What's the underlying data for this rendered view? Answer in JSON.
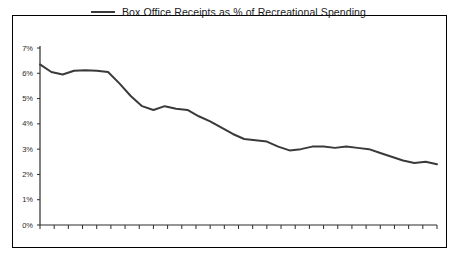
{
  "figure": {
    "width": 457,
    "height": 265,
    "background": "#ffffff",
    "border_color": "#000000"
  },
  "legend": {
    "position": "top-center",
    "marker": "line-swatch",
    "label": "Box Office Receipts as % of Recreational Spending",
    "color": "#3a3a3a"
  },
  "chart_data": {
    "type": "line",
    "title": "",
    "subtitle": "",
    "xlabel": "",
    "ylabel": "",
    "ylim": [
      0,
      7
    ],
    "ytick_labels": [
      "0%",
      "1%",
      "2%",
      "3%",
      "4%",
      "5%",
      "6%",
      "7%"
    ],
    "ytick_values": [
      0,
      1,
      2,
      3,
      4,
      5,
      6,
      7
    ],
    "xtick_labels": [],
    "xtick_count": 29,
    "grid": false,
    "legend_position": "top-center",
    "series": [
      {
        "name": "Box Office Receipts as % of Recreational Spending",
        "color": "#3a3a3a",
        "values": [
          6.35,
          6.05,
          5.95,
          6.1,
          6.12,
          6.1,
          6.05,
          5.6,
          5.1,
          4.7,
          4.55,
          4.7,
          4.6,
          4.55,
          4.3,
          4.1,
          3.85,
          3.6,
          3.4,
          3.35,
          3.3,
          3.1,
          2.95,
          3.0,
          3.1,
          3.1,
          3.05,
          3.1,
          3.05,
          3.0,
          2.85,
          2.7,
          2.55,
          2.45,
          2.5,
          2.4
        ]
      }
    ]
  }
}
